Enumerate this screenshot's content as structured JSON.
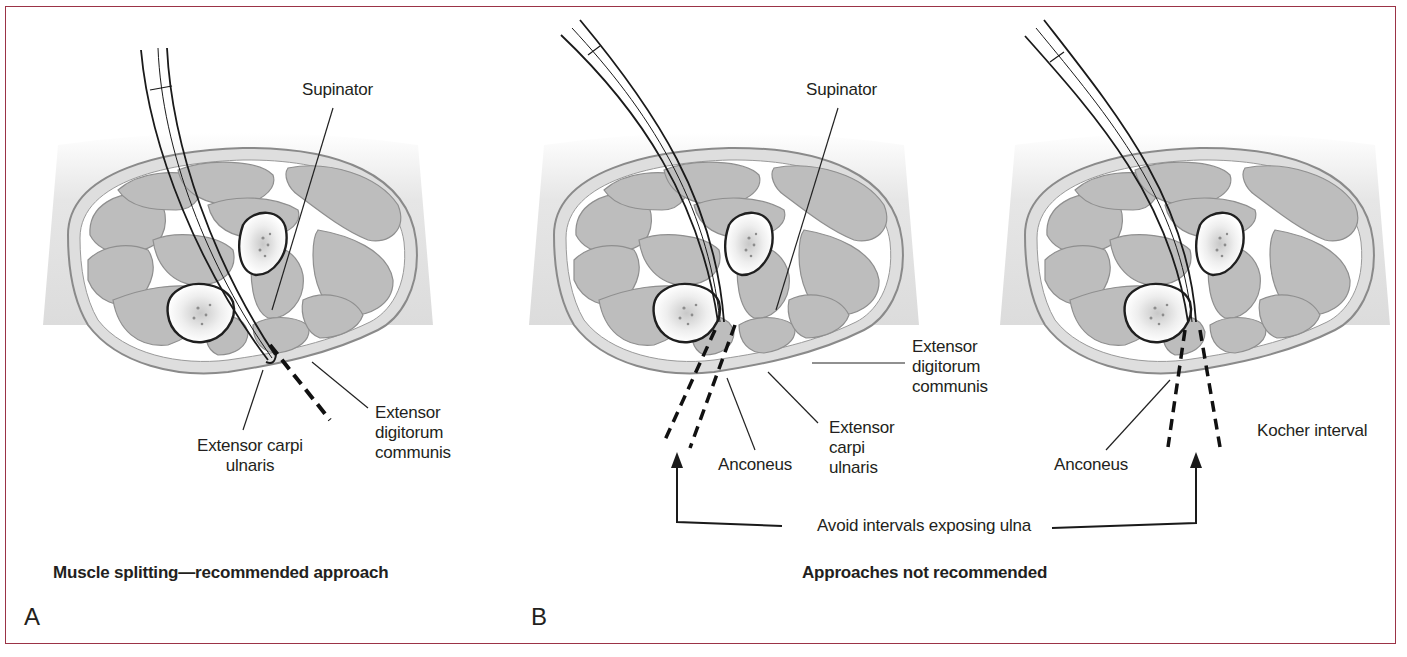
{
  "figure": {
    "frame_color": "#9b3346",
    "panels": [
      {
        "id": "A",
        "letter": "A",
        "caption": "Muscle splitting—recommended approach",
        "diagrams": [
          {
            "labels": {
              "supinator": "Supinator",
              "ecu_line1": "Extensor carpi",
              "ecu_line2": "ulnaris",
              "edc_line1": "Extensor",
              "edc_line2": "digitorum",
              "edc_line3": "communis"
            }
          }
        ]
      },
      {
        "id": "B",
        "letter": "B",
        "caption": "Approaches not recommended",
        "callout": "Avoid intervals exposing ulna",
        "diagrams": [
          {
            "labels": {
              "supinator": "Supinator",
              "edc_line1": "Extensor",
              "edc_line2": "digitorum",
              "edc_line3": "communis",
              "ecu_line1": "Extensor",
              "ecu_line2": "carpi",
              "ecu_line3": "ulnaris",
              "anconeus": "Anconeus"
            }
          },
          {
            "labels": {
              "anconeus": "Anconeus",
              "kocher": "Kocher interval"
            }
          }
        ]
      }
    ]
  }
}
